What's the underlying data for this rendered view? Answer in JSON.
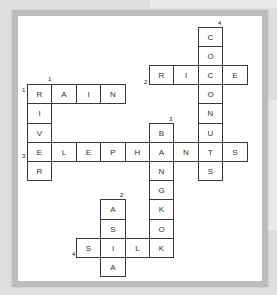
{
  "puzzle": {
    "type": "crossword",
    "grid": {
      "origin_x": 27,
      "origin_y": 26.5,
      "cell_w": 24.4,
      "cell_h": 19.2
    },
    "words": [
      {
        "number": "1",
        "direction": "across",
        "answer": "RAIN",
        "row": 3,
        "col": 0
      },
      {
        "number": "1",
        "direction": "down",
        "answer": "RIVER",
        "row": 3,
        "col": 0
      },
      {
        "number": "2",
        "direction": "across",
        "answer": "RICE",
        "row": 2,
        "col": 5
      },
      {
        "number": "3",
        "direction": "across",
        "answer": "ELEPHANTS",
        "row": 6,
        "col": 0
      },
      {
        "number": "3",
        "direction": "down",
        "answer": "BANGKOK",
        "row": 5,
        "col": 5
      },
      {
        "number": "4",
        "direction": "down",
        "answer": "COCONUTS",
        "row": 0,
        "col": 7
      },
      {
        "number": "2",
        "direction": "down",
        "answer": "ASIA",
        "row": 9,
        "col": 3
      },
      {
        "number": "4",
        "direction": "across",
        "answer": "SILK",
        "row": 11,
        "col": 2
      }
    ],
    "clue_numbers": [
      {
        "label": "1",
        "x": 48,
        "y": 76
      },
      {
        "label": "1",
        "x": 22,
        "y": 87
      },
      {
        "label": "2",
        "x": 144,
        "y": 79
      },
      {
        "label": "3",
        "x": 169,
        "y": 116
      },
      {
        "label": "3",
        "x": 22,
        "y": 153
      },
      {
        "label": "4",
        "x": 218,
        "y": 20
      },
      {
        "label": "2",
        "x": 120,
        "y": 192
      },
      {
        "label": "4",
        "x": 72,
        "y": 251
      }
    ]
  },
  "colors": {
    "background": "#dedede",
    "frame": "#bcbcbc",
    "paper": "#ffffff",
    "cell_border": "#3a3a3a",
    "letter": "#333333"
  }
}
